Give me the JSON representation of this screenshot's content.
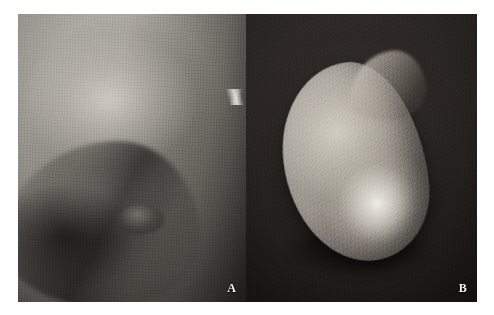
{
  "figure": {
    "kind": "two-panel clinical photograph figure",
    "background_color": "#ffffff",
    "width_px": 494,
    "height_px": 315
  },
  "panels": [
    {
      "id": "A",
      "label": "A",
      "label_color": "#f4f2ee",
      "position": "left",
      "subject": "clinical photograph of breast in profile",
      "background_color": "#8a8782",
      "tone": "grayscale",
      "features": {
        "areola_region": "areola-nipple-region",
        "inframammary_fold": "shaded-under-curve",
        "edge_highlight": "bright-wisp-right-edge"
      },
      "bounds": {
        "x": 18,
        "y": 14,
        "width": 228,
        "height": 288
      }
    },
    {
      "id": "B",
      "label": "B",
      "label_color": "#f4f2ee",
      "position": "right",
      "subject": "excised specimen on dark background",
      "background_color": "#231f1d",
      "tone": "grayscale",
      "features": {
        "specimen_shape": "teardrop-mass",
        "specimen_apex": "pointed-upper-right-apex",
        "cast_shadow": "soft-shadow-beneath"
      },
      "bounds": {
        "x": 246,
        "y": 14,
        "width": 231,
        "height": 288
      }
    }
  ]
}
